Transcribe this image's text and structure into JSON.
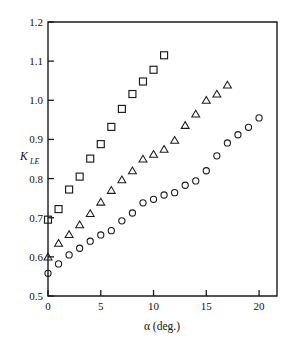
{
  "chart_data": {
    "type": "scatter",
    "title": "",
    "xlabel": "α (deg.)",
    "ylabel": "K_LE",
    "ylabel_main": "K",
    "ylabel_sub": "LE",
    "xlim": [
      0,
      21.7
    ],
    "ylim": [
      0.5,
      1.2
    ],
    "xticks": [
      0,
      5,
      10,
      15,
      20
    ],
    "xtick_labels": [
      "0",
      "5",
      "10",
      "15",
      "20"
    ],
    "yticks": [
      0.5,
      0.6,
      0.7,
      0.8,
      0.9,
      1.0,
      1.1,
      1.2
    ],
    "ytick_labels": [
      "0.5",
      "0.6",
      "0.7",
      "0.8",
      "0.9",
      "1.0",
      "1.1",
      "1.2"
    ],
    "grid": false,
    "legend": "none",
    "marker_color": "#1b1b1b",
    "background": "#ffffff",
    "series": [
      {
        "name": "squares",
        "marker": "square",
        "x": [
          0,
          1,
          2,
          3,
          4,
          5,
          6,
          7,
          8,
          9,
          10,
          11
        ],
        "values": [
          0.695,
          0.722,
          0.772,
          0.805,
          0.851,
          0.888,
          0.932,
          0.978,
          1.016,
          1.048,
          1.078,
          1.115
        ]
      },
      {
        "name": "triangles",
        "marker": "triangle",
        "x": [
          0,
          1,
          2,
          3,
          4,
          5,
          6,
          7,
          8,
          9,
          10,
          11,
          12,
          13,
          14,
          15,
          16,
          17
        ],
        "values": [
          0.6,
          0.635,
          0.657,
          0.682,
          0.711,
          0.74,
          0.77,
          0.797,
          0.82,
          0.85,
          0.862,
          0.875,
          0.898,
          0.936,
          0.965,
          1.0,
          1.016,
          1.039
        ]
      },
      {
        "name": "circles",
        "marker": "circle",
        "x": [
          0,
          1,
          2,
          3,
          4,
          5,
          6,
          7,
          8,
          9,
          10,
          11,
          12,
          13,
          14,
          15,
          16,
          17,
          18,
          19,
          20
        ],
        "values": [
          0.558,
          0.582,
          0.605,
          0.622,
          0.64,
          0.656,
          0.667,
          0.692,
          0.712,
          0.738,
          0.747,
          0.758,
          0.764,
          0.783,
          0.794,
          0.82,
          0.858,
          0.891,
          0.912,
          0.931,
          0.955
        ]
      }
    ]
  },
  "axis": {
    "x_title": "α (deg.)",
    "y_title_main": "K",
    "y_title_sub": "LE"
  }
}
